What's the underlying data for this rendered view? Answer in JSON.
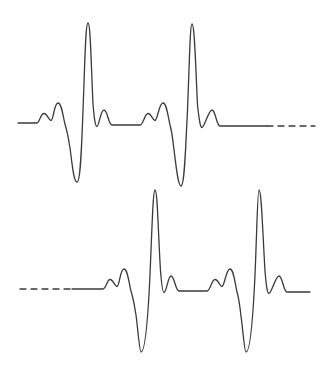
{
  "figure": {
    "name": "ecg-waveform-figure",
    "width": 325,
    "height": 375,
    "background_color": "#ffffff",
    "stroke_color": "#3a3a3a",
    "stroke_width": 1.3
  },
  "chart_data": {
    "type": "line",
    "title": "",
    "subtitle": "",
    "xlabel": "",
    "ylabel": "",
    "grid": false,
    "legend": "none",
    "axis_visible": false,
    "tick_labels": [],
    "annotations": [],
    "xlim": [
      0,
      325
    ],
    "ylim": [
      375,
      0
    ],
    "series": [
      {
        "name": "ecg-trace-top",
        "row": 1,
        "baseline_y": 123,
        "stroke": "#3a3a3a",
        "leading_style": "solid",
        "trailing_style": "dashed",
        "dash_pattern": "6,5",
        "dash_start_x": 267,
        "dash_end_x": 315,
        "x_start": 18,
        "x_end": 315,
        "features": [
          {
            "label": "baseline-start",
            "x": 18,
            "y": 123,
            "kind": "flat"
          },
          {
            "label": "p-wave-small",
            "x": 44,
            "y": 113,
            "kind": "peak"
          },
          {
            "label": "p-wave-notch",
            "x": 51,
            "y": 120,
            "kind": "trough"
          },
          {
            "label": "p-wave-large",
            "x": 58,
            "y": 103,
            "kind": "peak"
          },
          {
            "label": "q-wave",
            "x": 70,
            "y": 140,
            "kind": "trough"
          },
          {
            "label": "s-wave-deep",
            "x": 77,
            "y": 182,
            "kind": "trough"
          },
          {
            "label": "r-wave-tall",
            "x": 88,
            "y": 23,
            "kind": "peak"
          },
          {
            "label": "j-point",
            "x": 97,
            "y": 126,
            "kind": "trough"
          },
          {
            "label": "t-wave",
            "x": 104,
            "y": 110,
            "kind": "peak"
          },
          {
            "label": "isoelectric-segment",
            "x": 125,
            "y": 125,
            "kind": "flat"
          },
          {
            "label": "p-wave-small-2",
            "x": 148,
            "y": 113,
            "kind": "peak"
          },
          {
            "label": "p-wave-notch-2",
            "x": 155,
            "y": 120,
            "kind": "trough"
          },
          {
            "label": "p-wave-large-2",
            "x": 163,
            "y": 103,
            "kind": "peak"
          },
          {
            "label": "q-wave-2",
            "x": 174,
            "y": 142,
            "kind": "trough"
          },
          {
            "label": "s-wave-deep-2",
            "x": 181,
            "y": 186,
            "kind": "trough"
          },
          {
            "label": "r-wave-tall-2",
            "x": 192,
            "y": 24,
            "kind": "peak"
          },
          {
            "label": "j-point-2",
            "x": 202,
            "y": 127,
            "kind": "trough"
          },
          {
            "label": "t-wave-2",
            "x": 212,
            "y": 110,
            "kind": "peak"
          },
          {
            "label": "baseline-resume",
            "x": 224,
            "y": 126,
            "kind": "flat"
          },
          {
            "label": "baseline-dashed-end",
            "x": 315,
            "y": 126,
            "kind": "flat"
          }
        ]
      },
      {
        "name": "ecg-trace-bottom",
        "row": 2,
        "baseline_y": 289,
        "stroke": "#3a3a3a",
        "leading_style": "dashed",
        "trailing_style": "solid",
        "dash_pattern": "6,5",
        "dash_start_x": 20,
        "dash_end_x": 72,
        "x_start": 20,
        "x_end": 310,
        "features": [
          {
            "label": "baseline-dashed-start",
            "x": 20,
            "y": 289,
            "kind": "flat"
          },
          {
            "label": "baseline-solid-start",
            "x": 72,
            "y": 289,
            "kind": "flat"
          },
          {
            "label": "p-wave-small",
            "x": 110,
            "y": 279,
            "kind": "peak"
          },
          {
            "label": "p-wave-notch",
            "x": 117,
            "y": 286,
            "kind": "trough"
          },
          {
            "label": "p-wave-large",
            "x": 124,
            "y": 269,
            "kind": "peak"
          },
          {
            "label": "q-wave",
            "x": 135,
            "y": 307,
            "kind": "trough"
          },
          {
            "label": "s-wave-deep",
            "x": 141,
            "y": 352,
            "kind": "trough"
          },
          {
            "label": "r-wave-tall",
            "x": 155,
            "y": 190,
            "kind": "peak"
          },
          {
            "label": "j-point",
            "x": 164,
            "y": 292,
            "kind": "trough"
          },
          {
            "label": "t-wave",
            "x": 171,
            "y": 276,
            "kind": "peak"
          },
          {
            "label": "isoelectric-segment",
            "x": 192,
            "y": 291,
            "kind": "flat"
          },
          {
            "label": "p-wave-small-2",
            "x": 215,
            "y": 279,
            "kind": "peak"
          },
          {
            "label": "p-wave-notch-2",
            "x": 222,
            "y": 286,
            "kind": "trough"
          },
          {
            "label": "p-wave-large-2",
            "x": 230,
            "y": 269,
            "kind": "peak"
          },
          {
            "label": "q-wave-2",
            "x": 240,
            "y": 308,
            "kind": "trough"
          },
          {
            "label": "s-wave-deep-2",
            "x": 246,
            "y": 352,
            "kind": "trough"
          },
          {
            "label": "r-wave-tall-2",
            "x": 259,
            "y": 190,
            "kind": "peak"
          },
          {
            "label": "j-point-2",
            "x": 269,
            "y": 293,
            "kind": "trough"
          },
          {
            "label": "t-wave-2",
            "x": 279,
            "y": 276,
            "kind": "peak"
          },
          {
            "label": "baseline-end",
            "x": 310,
            "y": 292,
            "kind": "flat"
          }
        ]
      }
    ],
    "paths": {
      "top_solid": "M 18 123 L 37 123 C 39.5 123 40.5 113.5 44 113.5 C 47.5 113.5 48.5 120.5 51 120.5 C 53.5 120.5 54 103 58 103 C 62 103 63 118 65.5 126 C 68 134 68.5 140 70 148 C 72 162 73.5 182 77 182 C 80.5 182 81.5 150 83 110 C 85 60 85.5 23 88 23 C 90.5 23 91 62 93 104 C 94.5 122 95.5 126.5 97 126.5 C 99 126.5 100.5 110 104 110 C 107.5 110 108.5 125 112 125 C 114 125 118 125 125 125 L 140 125 C 143.5 125 144.5 113.5 148 113.5 C 151.5 113.5 152.5 120.5 155 120.5 C 157.5 120.5 159 103 163 103 C 167 103 168 118 170.5 127 C 172.5 135 173 142 174 150 C 176 165 178 186 181 186 C 184.5 186 185.5 150 187.5 110 C 189.5 62 190 24 192 24 C 194.5 24 195.5 63 197.5 105 C 199.5 123 200.5 127.5 202 127.5 C 204.5 127.5 208.5 110 212 110 C 215.5 110 216.5 126 220 126 C 223 126 235 126 267 126",
      "top_dashed": "M 267 126 L 315 126",
      "bottom_dashed": "M 20 289 L 72 289",
      "bottom_solid": "M 72 289 L 103 289 C 106 289 107 279.5 110 279.5 C 113.5 279.5 114.5 286.5 117 286.5 C 119.5 286.5 120 269 124 269 C 128 269 129 285 131.5 293 C 134 301 134.5 307 136 315 C 138 330 139.5 352 141 352 C 145 352 148 318 150 275 C 152 228 153 190 155 190 C 157.5 190 158 229 160.5 271 C 162 289 163 292.5 164 292.5 C 166.5 292.5 168 276 171 276 C 174.5 276 175.5 291 179 291 C 181 291 186 291 192 291 L 207 291 C 210.5 291 211.5 279.5 215 279.5 C 218.5 279.5 219.5 286.5 222 286.5 C 224.5 286.5 226 269 230 269 C 234 269 235 285 237.5 294 C 239.5 302 240 308 241 316 C 243 331 244.5 352 246 352 C 250 352 253 318 255 275 C 257 228 257.5 190 259 190 C 261.5 190 262.5 229 265 271 C 266.5 289 267.5 293.5 269 293.5 C 271.5 293.5 275.5 276 279 276 C 282.5 276 283.5 292 287 292 C 290 292 298 292 310 292"
    }
  }
}
